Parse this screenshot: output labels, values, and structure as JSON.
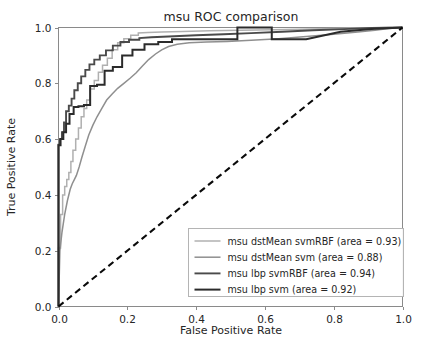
{
  "chart_data": {
    "type": "line",
    "title": "msu ROC comparison",
    "xlabel": "False Positive Rate",
    "ylabel": "True Positive Rate",
    "xlim": [
      0.0,
      1.0
    ],
    "ylim": [
      0.0,
      1.0
    ],
    "grid": false,
    "legend_position": "lower right",
    "xticks": [
      "0.0",
      "0.2",
      "0.4",
      "0.6",
      "0.8",
      "1.0"
    ],
    "xtick_values": [
      0.0,
      0.2,
      0.4,
      0.6,
      0.8,
      1.0
    ],
    "yticks": [
      "0.0",
      "0.2",
      "0.4",
      "0.6",
      "0.8",
      "1.0"
    ],
    "ytick_values": [
      0.0,
      0.2,
      0.4,
      0.6,
      0.8,
      1.0
    ],
    "annotations": [
      "Dashed black diagonal from (0,0) to (1,1) indicates chance level"
    ],
    "reference_line": {
      "name": "chance-diagonal",
      "style": "dashed",
      "color": "#0a0a0a",
      "x": [
        0.0,
        1.0
      ],
      "y": [
        0.0,
        1.0
      ]
    },
    "series": [
      {
        "name": "msu dstMean svmRBF",
        "area": 0.93,
        "legend_label": "msu dstMean svmRBF (area = 0.93)",
        "color": "#b0b0b0",
        "linewidth": 1.5,
        "x": [
          0.0,
          0.0,
          0.006,
          0.006,
          0.012,
          0.012,
          0.018,
          0.018,
          0.024,
          0.024,
          0.03,
          0.03,
          0.036,
          0.036,
          0.042,
          0.042,
          0.05,
          0.05,
          0.058,
          0.058,
          0.066,
          0.066,
          0.074,
          0.074,
          0.082,
          0.082,
          0.092,
          0.092,
          0.104,
          0.104,
          0.116,
          0.116,
          0.128,
          0.128,
          0.142,
          0.142,
          0.156,
          0.156,
          0.172,
          0.172,
          0.19,
          0.19,
          0.21,
          0.21,
          0.232,
          0.232,
          0.26,
          0.3,
          0.36,
          0.44,
          0.53,
          0.62,
          0.7,
          0.8,
          0.88,
          0.93,
          0.96,
          1.0
        ],
        "y": [
          0.0,
          0.21,
          0.21,
          0.33,
          0.33,
          0.4,
          0.4,
          0.43,
          0.43,
          0.455,
          0.455,
          0.48,
          0.48,
          0.52,
          0.52,
          0.56,
          0.56,
          0.6,
          0.6,
          0.64,
          0.64,
          0.68,
          0.68,
          0.71,
          0.71,
          0.74,
          0.74,
          0.78,
          0.78,
          0.81,
          0.81,
          0.84,
          0.84,
          0.865,
          0.865,
          0.89,
          0.89,
          0.92,
          0.92,
          0.945,
          0.945,
          0.96,
          0.96,
          0.972,
          0.972,
          0.98,
          0.982,
          0.984,
          0.986,
          0.988,
          0.99,
          0.992,
          0.994,
          0.996,
          0.998,
          0.999,
          1.0,
          1.0
        ]
      },
      {
        "name": "msu dstMean svm",
        "area": 0.88,
        "legend_label": "msu dstMean svm (area = 0.88)",
        "color": "#8f8f8f",
        "linewidth": 1.5,
        "x": [
          0.0,
          0.004,
          0.01,
          0.018,
          0.026,
          0.034,
          0.04,
          0.046,
          0.052,
          0.06,
          0.068,
          0.078,
          0.088,
          0.1,
          0.112,
          0.126,
          0.14,
          0.156,
          0.172,
          0.19,
          0.208,
          0.226,
          0.244,
          0.262,
          0.282,
          0.3,
          0.32,
          0.345,
          0.38,
          0.43,
          0.49,
          0.56,
          0.64,
          0.72,
          0.8,
          0.87,
          0.92,
          0.96,
          1.0
        ],
        "y": [
          0.0,
          0.2,
          0.265,
          0.33,
          0.38,
          0.42,
          0.44,
          0.455,
          0.47,
          0.5,
          0.535,
          0.575,
          0.615,
          0.65,
          0.68,
          0.71,
          0.74,
          0.762,
          0.782,
          0.8,
          0.818,
          0.838,
          0.862,
          0.885,
          0.905,
          0.92,
          0.932,
          0.94,
          0.945,
          0.948,
          0.95,
          0.954,
          0.96,
          0.968,
          0.976,
          0.984,
          0.99,
          0.996,
          1.0
        ]
      },
      {
        "name": "msu lbp svmRBF",
        "area": 0.94,
        "legend_label": "msu lbp svmRBF (area = 0.94)",
        "color": "#4a4a4a",
        "linewidth": 1.9,
        "x": [
          0.0,
          0.0,
          0.004,
          0.004,
          0.01,
          0.01,
          0.016,
          0.016,
          0.022,
          0.022,
          0.03,
          0.03,
          0.038,
          0.038,
          0.046,
          0.046,
          0.056,
          0.056,
          0.066,
          0.066,
          0.078,
          0.078,
          0.09,
          0.09,
          0.104,
          0.104,
          0.12,
          0.12,
          0.138,
          0.138,
          0.158,
          0.158,
          0.18,
          0.18,
          0.205,
          0.205,
          0.235,
          0.235,
          0.27,
          0.32,
          0.4,
          0.48,
          0.56,
          0.65,
          0.74,
          0.83,
          0.91,
          1.0
        ],
        "y": [
          0.0,
          0.58,
          0.58,
          0.6,
          0.6,
          0.625,
          0.625,
          0.66,
          0.66,
          0.7,
          0.7,
          0.72,
          0.72,
          0.745,
          0.745,
          0.775,
          0.775,
          0.8,
          0.8,
          0.825,
          0.825,
          0.848,
          0.848,
          0.868,
          0.868,
          0.885,
          0.885,
          0.9,
          0.9,
          0.918,
          0.918,
          0.935,
          0.935,
          0.948,
          0.948,
          0.956,
          0.956,
          0.962,
          0.965,
          0.968,
          0.972,
          0.976,
          0.98,
          0.985,
          0.99,
          0.994,
          0.998,
          1.0
        ]
      },
      {
        "name": "msu lbp svm",
        "area": 0.92,
        "legend_label": "msu lbp svm (area = 0.92)",
        "color": "#2b2b2b",
        "linewidth": 2.0,
        "x": [
          0.0,
          0.0,
          0.006,
          0.006,
          0.014,
          0.014,
          0.022,
          0.022,
          0.032,
          0.032,
          0.044,
          0.044,
          0.058,
          0.058,
          0.074,
          0.074,
          0.092,
          0.092,
          0.112,
          0.112,
          0.134,
          0.134,
          0.158,
          0.158,
          0.185,
          0.185,
          0.215,
          0.215,
          0.25,
          0.25,
          0.29,
          0.29,
          0.33,
          0.33,
          0.52,
          0.52,
          0.62,
          0.62,
          0.72,
          0.82,
          0.91,
          1.0
        ],
        "y": [
          0.0,
          0.578,
          0.578,
          0.6,
          0.6,
          0.625,
          0.625,
          0.655,
          0.655,
          0.69,
          0.69,
          0.715,
          0.715,
          0.718,
          0.718,
          0.722,
          0.722,
          0.79,
          0.79,
          0.795,
          0.795,
          0.845,
          0.845,
          0.858,
          0.858,
          0.9,
          0.9,
          0.92,
          0.92,
          0.94,
          0.94,
          0.948,
          0.948,
          0.958,
          0.958,
          1.0,
          1.0,
          0.958,
          0.958,
          0.985,
          0.995,
          1.0
        ]
      }
    ]
  }
}
